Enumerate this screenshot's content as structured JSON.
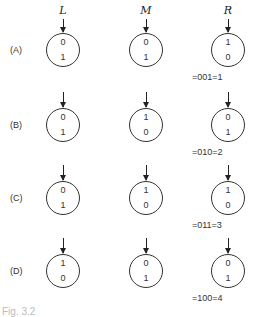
{
  "columns": [
    {
      "label": "L",
      "x": 63
    },
    {
      "label": "M",
      "x": 146
    },
    {
      "label": "R",
      "x": 228
    }
  ],
  "rows": [
    {
      "label": "(A)",
      "cy": 50,
      "circles": [
        {
          "top": "0",
          "bottom": "1"
        },
        {
          "top": "0",
          "bottom": "1"
        },
        {
          "top": "1",
          "bottom": "0"
        }
      ],
      "equation": "=001=1"
    },
    {
      "label": "(B)",
      "cy": 125,
      "circles": [
        {
          "top": "0",
          "bottom": "1"
        },
        {
          "top": "1",
          "bottom": "0"
        },
        {
          "top": "0",
          "bottom": "1"
        }
      ],
      "equation": "=010=2"
    },
    {
      "label": "(C)",
      "cy": 198,
      "circles": [
        {
          "top": "0",
          "bottom": "1"
        },
        {
          "top": "1",
          "bottom": "0"
        },
        {
          "top": "1",
          "bottom": "0"
        }
      ],
      "equation": "=011=3"
    },
    {
      "label": "(D)",
      "cy": 271,
      "circles": [
        {
          "top": "1",
          "bottom": "0"
        },
        {
          "top": "0",
          "bottom": "1"
        },
        {
          "top": "0",
          "bottom": "1"
        }
      ],
      "equation": "=100=4"
    }
  ],
  "caption": "Fig. 3.2"
}
